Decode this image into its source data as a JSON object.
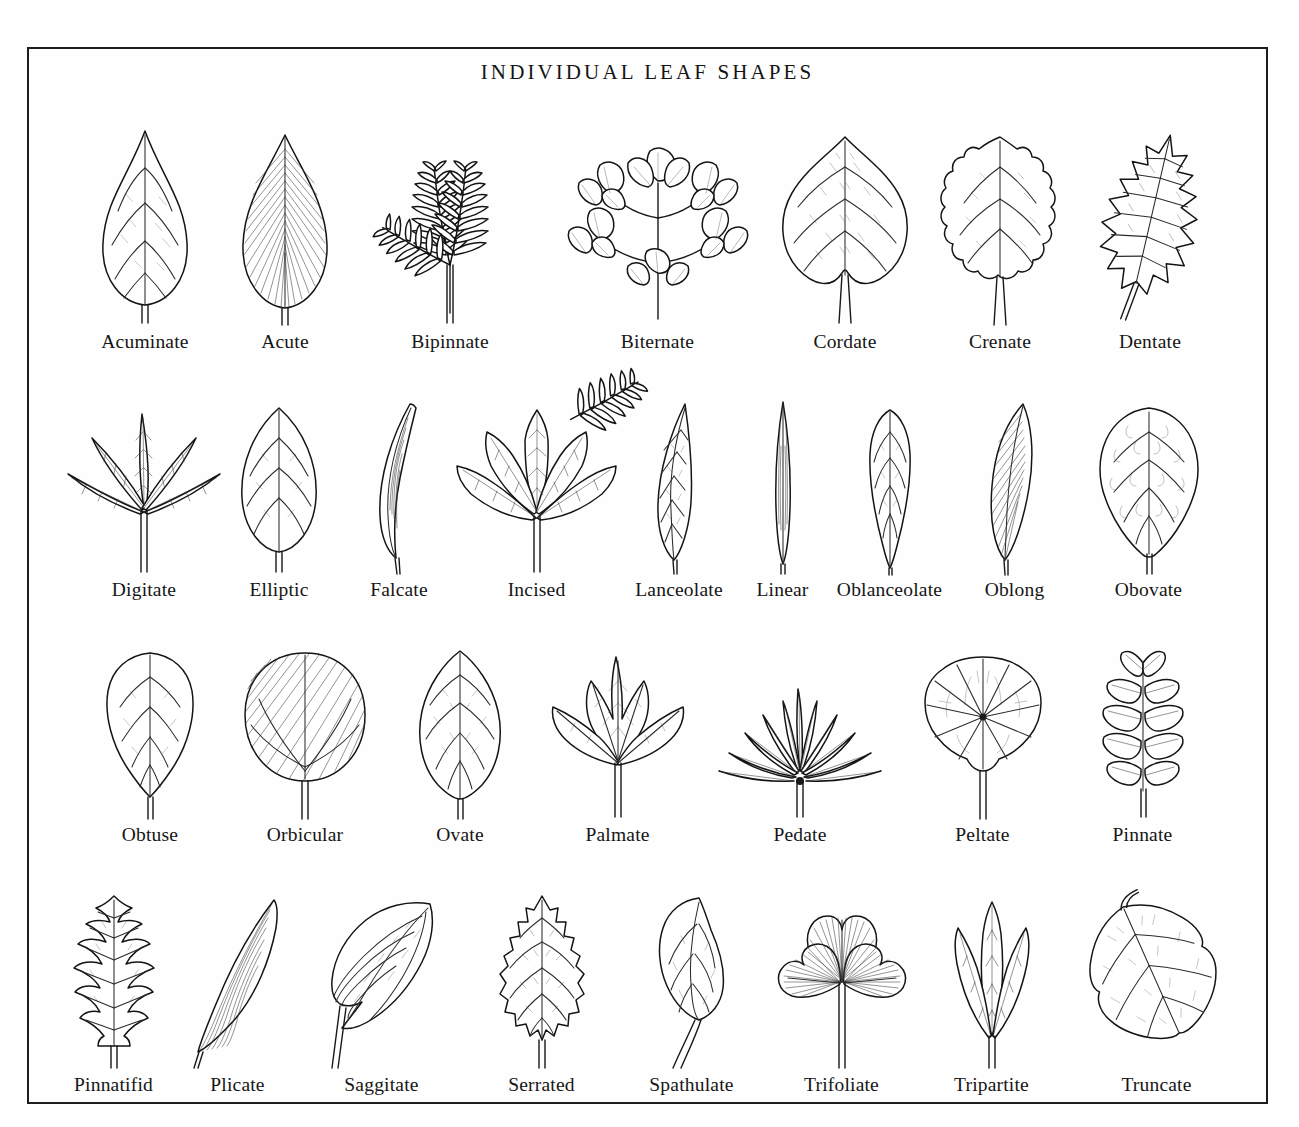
{
  "plate": {
    "title": "INDIVIDUAL LEAF SHAPES",
    "border_color": "#1d1d1d",
    "background_color": "#fefefe",
    "ink_color": "#141414"
  },
  "rows": [
    {
      "index": 1,
      "items": [
        {
          "label": "Acuminate",
          "shape": "simple-leaf-acuminate-tip"
        },
        {
          "label": "Acute",
          "shape": "simple-leaf-acute-hatched"
        },
        {
          "label": "Bipinnate",
          "shape": "compound-bipinnate-fronds"
        },
        {
          "label": "Biternate",
          "shape": "compound-biternate-lobed-leaflets"
        },
        {
          "label": "Cordate",
          "shape": "heart-shaped-stippled"
        },
        {
          "label": "Crenate",
          "shape": "scalloped-margin-leaf"
        },
        {
          "label": "Dentate",
          "shape": "toothed-margin-leaf"
        }
      ]
    },
    {
      "index": 2,
      "items": [
        {
          "label": "Digitate",
          "shape": "palmately-compound-five-leaflets"
        },
        {
          "label": "Elliptic",
          "shape": "ellipse-leaf"
        },
        {
          "label": "Falcate",
          "shape": "sickle-curved-blade"
        },
        {
          "label": "Incised",
          "shape": "deeply-cut-palmate-leaf"
        },
        {
          "label": "Lanceolate",
          "shape": "lance-shaped-leaf"
        },
        {
          "label": "Linear",
          "shape": "very-narrow-strap-leaf"
        },
        {
          "label": "Oblanceolate",
          "shape": "inverted-lance-leaf"
        },
        {
          "label": "Oblong",
          "shape": "oblong-hatched-blade"
        },
        {
          "label": "Obovate",
          "shape": "inverted-egg-leaf"
        }
      ]
    },
    {
      "index": 3,
      "items": [
        {
          "label": "Obtuse",
          "shape": "blunt-tip-leaf"
        },
        {
          "label": "Orbicular",
          "shape": "round-hatched-leaf"
        },
        {
          "label": "Ovate",
          "shape": "egg-shaped-leaf"
        },
        {
          "label": "Palmate",
          "shape": "five-lobed-palmate-leaf"
        },
        {
          "label": "Pedate",
          "shape": "pedate-divided-narrow-segments"
        },
        {
          "label": "Peltate",
          "shape": "shield-leaf-central-stalk"
        },
        {
          "label": "Pinnate",
          "shape": "pinnately-compound-leaflets"
        }
      ]
    },
    {
      "index": 4,
      "items": [
        {
          "label": "Pinnatifid",
          "shape": "pinnately-lobed-leaf"
        },
        {
          "label": "Plicate",
          "shape": "folded-pleated-blade"
        },
        {
          "label": "Saggitate",
          "shape": "arrowhead-leaf"
        },
        {
          "label": "Serrated",
          "shape": "saw-tooth-margin-leaf"
        },
        {
          "label": "Spathulate",
          "shape": "spoon-shaped-leaf"
        },
        {
          "label": "Trifoliate",
          "shape": "three-heart-leaflets-clover"
        },
        {
          "label": "Tripartite",
          "shape": "three-narrow-parted-blades"
        },
        {
          "label": "Truncate",
          "shape": "flat-based-broad-leaf"
        }
      ]
    }
  ]
}
